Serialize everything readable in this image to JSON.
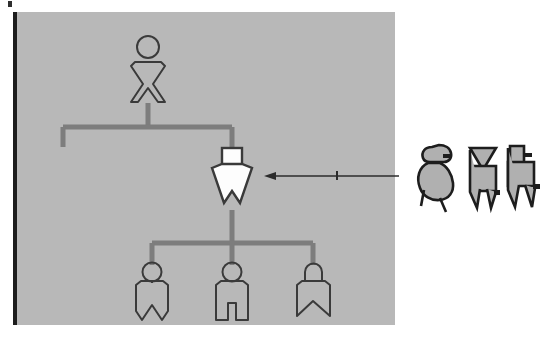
{
  "figure": {
    "panel": {
      "name": "diagram-panel",
      "fill_color": "#b8b8b8",
      "border_color": "#1d1d1d",
      "x": 13,
      "y": 12,
      "width": 382,
      "height": 313
    },
    "page_background": "#ffffff",
    "corner_mark": {
      "name": "corner-tick",
      "color": "#2e2e2e"
    }
  },
  "style": {
    "outline_color": "#3a3a3a",
    "connector_color": "#7d7d7d",
    "highlight_fill": "#fdfdfd",
    "legend_fill": "#b0b0b0",
    "legend_outline": "#1d1d1d",
    "arrow_color": "#2b2b2b"
  },
  "nodes": [
    {
      "id": "n1",
      "name": "ancestor-figure",
      "label": "",
      "generation": 1,
      "head_shape": "circle",
      "body_shape": "hourglass",
      "fill": "none",
      "highlighted": false,
      "x": 148,
      "y": 68
    },
    {
      "id": "n2",
      "name": "focus-figure",
      "label": "",
      "generation": 2,
      "head_shape": "square",
      "body_shape": "triangle-down-notched",
      "fill": "#fdfdfd",
      "highlighted": true,
      "x": 232,
      "y": 178
    },
    {
      "id": "n3",
      "name": "descendant-figure-1",
      "label": "",
      "generation": 3,
      "head_shape": "circle",
      "body_shape": "rect-v-notch",
      "fill": "none",
      "highlighted": false,
      "x": 152,
      "y": 290
    },
    {
      "id": "n4",
      "name": "descendant-figure-2",
      "label": "",
      "generation": 3,
      "head_shape": "circle",
      "body_shape": "rect-slot-legs",
      "fill": "none",
      "highlighted": false,
      "x": 232,
      "y": 290
    },
    {
      "id": "n5",
      "name": "descendant-figure-3",
      "label": "",
      "generation": 3,
      "head_shape": "arch",
      "body_shape": "rect-ribbon-notch",
      "fill": "none",
      "highlighted": false,
      "x": 313,
      "y": 290
    }
  ],
  "connectors": [
    {
      "name": "connector-generation-1-to-2",
      "from": "n1",
      "to": "n2"
    },
    {
      "name": "connector-generation-2-to-3",
      "from": "n2",
      "to": [
        "n3",
        "n4",
        "n5"
      ]
    }
  ],
  "annotation": {
    "name": "pointer-arrow",
    "text": "",
    "from_x": 399,
    "to_x": 268,
    "y": 176,
    "direction": "left",
    "color": "#2b2b2b",
    "tick_mark": true
  },
  "legend": {
    "name": "legend-figures",
    "title": "",
    "items": [
      {
        "id": "L1",
        "name": "legend-figure-rounded",
        "label": "",
        "head_shape": "round-profile",
        "body_shape": "blob",
        "fill": "#b0b0b0",
        "x": 434,
        "y": 176
      },
      {
        "id": "L2",
        "name": "legend-figure-triangle",
        "label": "",
        "head_shape": "triangle-down",
        "body_shape": "split-legs",
        "fill": "#b0b0b0",
        "x": 480,
        "y": 176
      },
      {
        "id": "L3",
        "name": "legend-figure-square",
        "label": "",
        "head_shape": "square",
        "body_shape": "splayed-legs",
        "fill": "#b0b0b0",
        "x": 520,
        "y": 176
      }
    ]
  }
}
